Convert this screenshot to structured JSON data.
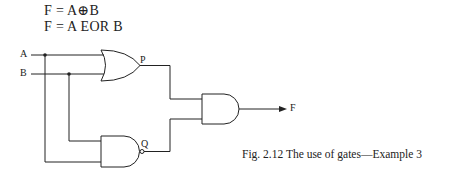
{
  "equations": {
    "line1": "F = A⊕B",
    "line2": "F = A  EOR  B"
  },
  "labels": {
    "input_a": "A",
    "input_b": "B",
    "or_output": "P",
    "nand_output": "Q",
    "final_output": "F"
  },
  "gates": [
    {
      "id": "or-gate",
      "type": "OR",
      "inputs": [
        "A",
        "B"
      ],
      "output": "P"
    },
    {
      "id": "nand-gate",
      "type": "NAND",
      "inputs": [
        "B",
        "A"
      ],
      "output": "Q"
    },
    {
      "id": "and-gate",
      "type": "AND",
      "inputs": [
        "P",
        "Q"
      ],
      "output": "F"
    }
  ],
  "caption": "Fig. 2.12  The use of gates—Example 3",
  "colors": {
    "line": "#222222",
    "background": "#ffffff"
  }
}
